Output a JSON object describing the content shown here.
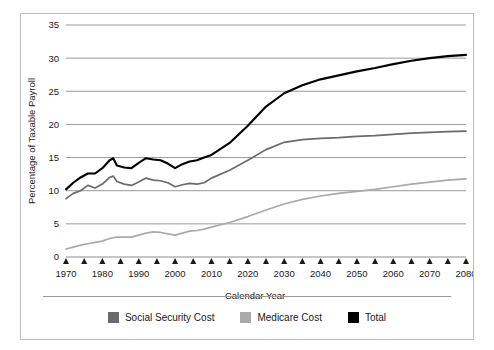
{
  "chart_data": {
    "type": "line",
    "title": "",
    "xlabel": "Calendar Year",
    "ylabel": "Percentage of Taxable Payroll",
    "xlim": [
      1970,
      2080
    ],
    "ylim": [
      0,
      35
    ],
    "xticks": [
      1970,
      1980,
      1990,
      2000,
      2010,
      2020,
      2030,
      2040,
      2050,
      2060,
      2070,
      2080
    ],
    "xtick_labels": [
      "1970",
      "1980",
      "1990",
      "2000",
      "2010",
      "2020",
      "2030",
      "2040",
      "2050",
      "2060",
      "2070",
      "2080"
    ],
    "minor_xtick_interval": 5,
    "yticks": [
      0,
      5,
      10,
      15,
      20,
      25,
      30,
      35
    ],
    "ytick_labels": [
      "0",
      "5",
      "10",
      "15",
      "20",
      "25",
      "30",
      "35"
    ],
    "grid": "horizontal",
    "legend_position": "bottom",
    "x": [
      1970,
      1972,
      1974,
      1976,
      1978,
      1980,
      1982,
      1983,
      1984,
      1986,
      1988,
      1990,
      1992,
      1994,
      1996,
      1998,
      2000,
      2002,
      2004,
      2006,
      2008,
      2010,
      2015,
      2020,
      2025,
      2030,
      2035,
      2040,
      2045,
      2050,
      2055,
      2060,
      2065,
      2070,
      2075,
      2080
    ],
    "series": [
      {
        "name": "Social Security Cost",
        "color": "#6b6b6b",
        "values": [
          8.8,
          9.6,
          10.0,
          10.8,
          10.4,
          11.0,
          12.0,
          12.2,
          11.4,
          11.0,
          10.8,
          11.3,
          11.9,
          11.6,
          11.5,
          11.2,
          10.6,
          10.9,
          11.1,
          11.0,
          11.2,
          11.9,
          13.1,
          14.6,
          16.2,
          17.3,
          17.7,
          17.9,
          18.0,
          18.2,
          18.3,
          18.5,
          18.7,
          18.8,
          18.9,
          19.0
        ]
      },
      {
        "name": "Medicare Cost",
        "color": "#aaaaaa",
        "values": [
          1.2,
          1.5,
          1.8,
          2.0,
          2.2,
          2.4,
          2.8,
          2.9,
          3.0,
          3.0,
          3.0,
          3.3,
          3.6,
          3.8,
          3.7,
          3.5,
          3.3,
          3.6,
          3.9,
          4.0,
          4.2,
          4.5,
          5.2,
          6.1,
          7.1,
          8.0,
          8.7,
          9.2,
          9.6,
          9.9,
          10.2,
          10.6,
          11.0,
          11.3,
          11.6,
          11.8
        ]
      },
      {
        "name": "Total",
        "color": "#000000",
        "values": [
          10.2,
          11.2,
          12.0,
          12.6,
          12.6,
          13.4,
          14.6,
          14.9,
          13.8,
          13.5,
          13.4,
          14.2,
          14.9,
          14.7,
          14.6,
          14.1,
          13.4,
          14.0,
          14.4,
          14.6,
          15.0,
          15.4,
          17.2,
          19.8,
          22.7,
          24.7,
          25.9,
          26.8,
          27.4,
          28.0,
          28.5,
          29.1,
          29.6,
          30.0,
          30.3,
          30.5
        ]
      }
    ]
  },
  "legend": {
    "items": [
      {
        "label": "Social Security Cost",
        "color": "#6b6b6b"
      },
      {
        "label": "Medicare Cost",
        "color": "#aaaaaa"
      },
      {
        "label": "Total",
        "color": "#000000"
      }
    ]
  }
}
